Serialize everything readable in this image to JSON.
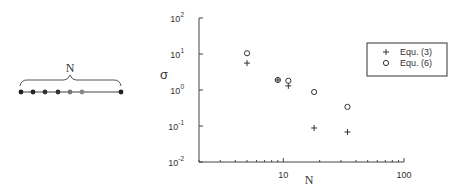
{
  "schematic": {
    "brace_label": "N",
    "dot_count_visible": 7
  },
  "chart_data": {
    "type": "scatter",
    "title": "",
    "xlabel": "N",
    "ylabel": "σ",
    "xscale": "log",
    "yscale": "log",
    "xlim": [
      2,
      100
    ],
    "ylim": [
      0.01,
      100
    ],
    "x_ticks": [
      {
        "value": 10,
        "label": "10"
      },
      {
        "value": 100,
        "label": "100"
      }
    ],
    "y_ticks": [
      {
        "value": 100,
        "label": "10",
        "exp": "2"
      },
      {
        "value": 10,
        "label": "10",
        "exp": "1"
      },
      {
        "value": 1,
        "label": "10",
        "exp": "0"
      },
      {
        "value": 0.1,
        "label": "10",
        "exp": "-1"
      },
      {
        "value": 0.01,
        "label": "10",
        "exp": "-2"
      }
    ],
    "grid": false,
    "legend_position": "upper right",
    "series": [
      {
        "name": "Equ. (3)",
        "marker": "+",
        "points": [
          {
            "x": 5,
            "y": 5.6
          },
          {
            "x": 9,
            "y": 1.9
          },
          {
            "x": 11,
            "y": 1.3
          },
          {
            "x": 18,
            "y": 0.088
          },
          {
            "x": 34,
            "y": 0.068
          }
        ]
      },
      {
        "name": "Equ. (6)",
        "marker": "o",
        "points": [
          {
            "x": 5,
            "y": 10.5
          },
          {
            "x": 9,
            "y": 1.9
          },
          {
            "x": 11,
            "y": 1.8
          },
          {
            "x": 18,
            "y": 0.88
          },
          {
            "x": 34,
            "y": 0.34
          }
        ]
      }
    ]
  }
}
